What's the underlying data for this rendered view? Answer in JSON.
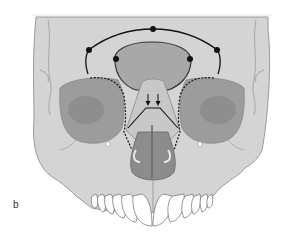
{
  "figure": {
    "panel_label": "b",
    "colors": {
      "bone": "#d4d4d4",
      "bone_outline": "#9a9a9a",
      "sinus": "#a8a8a8",
      "orbit": "#9c9c9c",
      "nasal_cavity": "#8c8c8c",
      "teeth": "#ffffff",
      "lines": "#111111",
      "background": "#ffffff"
    },
    "annotations": {
      "outer_arc_points": 3,
      "inner_arc_points": 2,
      "arrows": 2,
      "dashed_orbit_lines": 2
    }
  }
}
